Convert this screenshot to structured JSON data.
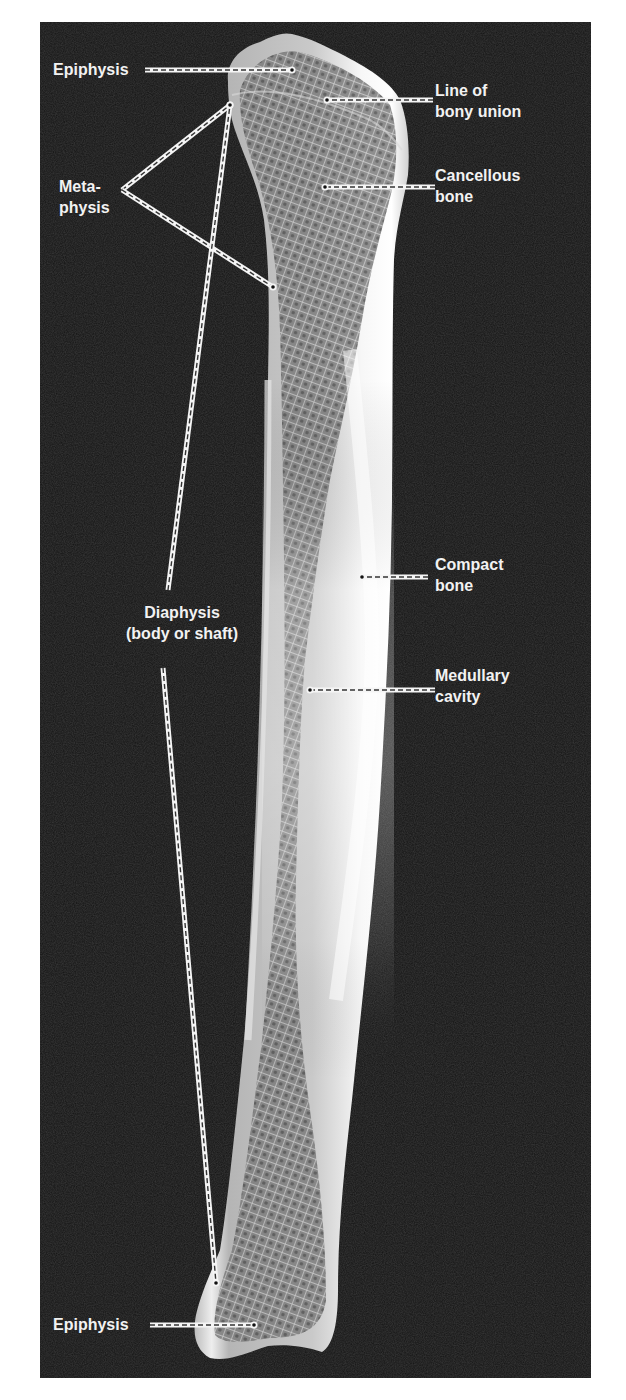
{
  "figure": {
    "colors": {
      "background": "#141414",
      "bone": "#e8e8e8",
      "label_text": "#f2f2f2",
      "leader_line": "#f5f5f5",
      "leader_dash": "#333333"
    }
  },
  "labels": {
    "epiphysis_top": {
      "lines": [
        "Epiphysis"
      ]
    },
    "metaphysis": {
      "lines": [
        "Meta-",
        "physis"
      ]
    },
    "line_of_bony_union": {
      "lines": [
        "Line of",
        "bony union"
      ]
    },
    "cancellous_bone": {
      "lines": [
        "Cancellous",
        "bone"
      ]
    },
    "diaphysis": {
      "lines": [
        "Diaphysis",
        "(body or shaft)"
      ]
    },
    "compact_bone": {
      "lines": [
        "Compact",
        "bone"
      ]
    },
    "medullary_cavity": {
      "lines": [
        "Medullary",
        "cavity"
      ]
    },
    "epiphysis_bottom": {
      "lines": [
        "Epiphysis"
      ]
    }
  },
  "leaders": [
    {
      "id": "epiphysis-top-leader",
      "points": [
        [
          145,
          70
        ],
        [
          292,
          70
        ]
      ]
    },
    {
      "id": "line-of-bony-union-leader",
      "points": [
        [
          433,
          100
        ],
        [
          327,
          100
        ]
      ]
    },
    {
      "id": "metaphysis-leader-upper",
      "points": [
        [
          122,
          190
        ],
        [
          230,
          105
        ]
      ]
    },
    {
      "id": "metaphysis-leader-lower",
      "points": [
        [
          122,
          190
        ],
        [
          273,
          287
        ]
      ]
    },
    {
      "id": "cancellous-bone-leader",
      "points": [
        [
          435,
          187
        ],
        [
          325,
          187
        ]
      ]
    },
    {
      "id": "diaphysis-leader-upper",
      "points": [
        [
          168,
          590
        ],
        [
          230,
          105
        ]
      ]
    },
    {
      "id": "compact-bone-leader",
      "points": [
        [
          428,
          577
        ],
        [
          362,
          577
        ]
      ]
    },
    {
      "id": "medullary-cavity-leader",
      "points": [
        [
          435,
          690
        ],
        [
          310,
          690
        ]
      ]
    },
    {
      "id": "diaphysis-leader-lower",
      "points": [
        [
          163,
          668
        ],
        [
          216,
          1283
        ]
      ]
    },
    {
      "id": "epiphysis-bottom-leader",
      "points": [
        [
          150,
          1325
        ],
        [
          254,
          1325
        ]
      ]
    }
  ]
}
